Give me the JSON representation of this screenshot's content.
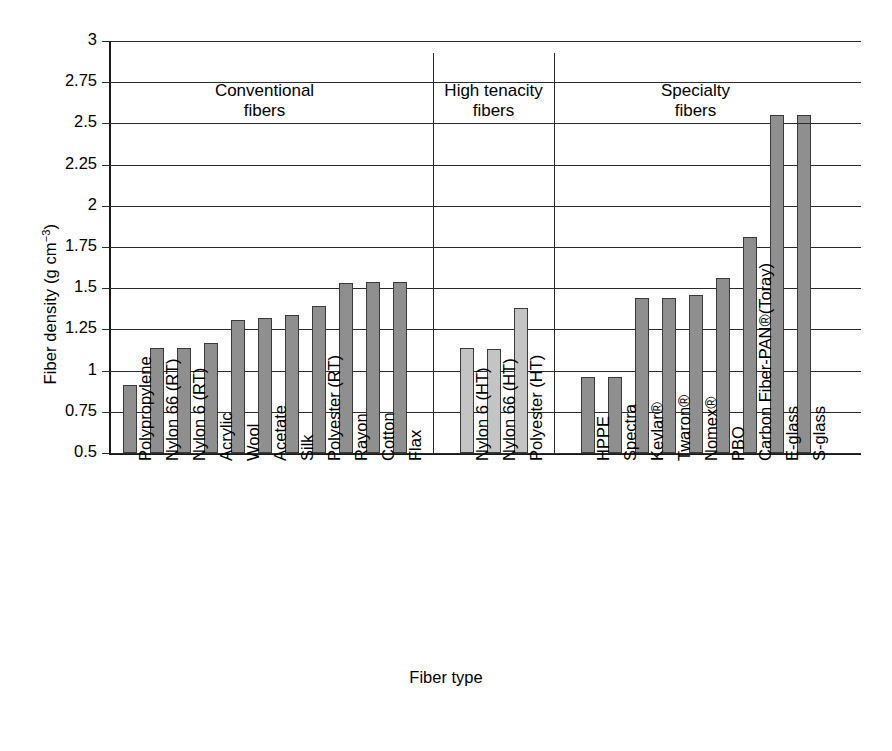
{
  "chart_data": {
    "type": "bar",
    "title": "",
    "xlabel": "Fiber type",
    "ylabel": "Fiber density (g cm−3)",
    "ylabel_base": "Fiber density (g cm",
    "ylabel_exp": "−3",
    "ylabel_tail": ")",
    "ylim": [
      0.5,
      3
    ],
    "ytick_step": 0.25,
    "ytick_labels": [
      "3",
      "2.75",
      "2.5",
      "2.25",
      "2",
      "1.75",
      "1.5",
      "1.25",
      "1",
      "0.75",
      "0.5"
    ],
    "ytick_values": [
      3,
      2.75,
      2.5,
      2.25,
      2,
      1.75,
      1.5,
      1.25,
      1,
      0.75,
      0.5
    ],
    "grid": true,
    "legend": "none",
    "categories": [
      "Polypropylene",
      "Nylon 66 (RT)",
      "Nylon 6 (RT)",
      "Acrylic",
      "Wool",
      "Acetate",
      "Silk",
      "Polyester (RT)",
      "Rayon",
      "Cotton",
      "Flax",
      "Nylon 6 (HT)",
      "Nylon 66 (HT)",
      "Polyester (HT)",
      "HPPE",
      "Spectra",
      "Kevlar®",
      "Twaron®",
      "Nomex®",
      "PBO",
      "Carbon Fiber-PAN®(Toray)",
      "E-glass",
      "S-glass"
    ],
    "values": [
      0.91,
      1.14,
      1.14,
      1.17,
      1.31,
      1.32,
      1.34,
      1.39,
      1.53,
      1.54,
      1.54,
      1.14,
      1.13,
      1.38,
      0.96,
      0.96,
      1.44,
      1.44,
      1.46,
      1.56,
      1.81,
      2.55,
      2.55
    ],
    "groups": [
      {
        "name": "conventional",
        "label_line1": "Conventional",
        "label_line2": "fibers",
        "start": 0,
        "count": 11,
        "color": "#8f8f8f"
      },
      {
        "name": "high-tenacity",
        "label_line1": "High tenacity",
        "label_line2": "fibers",
        "start": 11,
        "count": 3,
        "color": "#c4c4c4"
      },
      {
        "name": "specialty",
        "label_line1": "Specialty",
        "label_line2": "fibers",
        "start": 14,
        "count": 9,
        "color": "#8f8f8f"
      }
    ],
    "colors": {
      "conventional_bar": "#8f8f8f",
      "high_tenacity_bar": "#c4c4c4",
      "specialty_bar": "#8f8f8f",
      "axis": "#1a1a1a",
      "grid": "#2b2b2b",
      "background": "#ffffff"
    }
  }
}
